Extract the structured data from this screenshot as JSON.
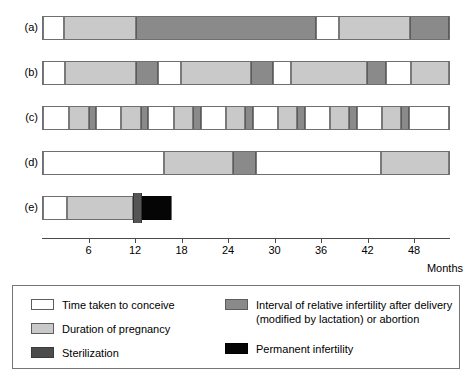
{
  "chart_data": {
    "type": "bar",
    "title": "",
    "subtitle": "",
    "xlabel": "Months",
    "ylabel": "",
    "xlim": [
      0,
      52.6
    ],
    "grid": false,
    "legend_position": "bottom",
    "axis": {
      "unit_label": "Months",
      "ticks": [
        6,
        12,
        18,
        24,
        30,
        36,
        42,
        48
      ],
      "tick_labels": [
        "6",
        "12",
        "18",
        "24",
        "30",
        "36",
        "42",
        "48"
      ],
      "start": 0,
      "end": 52.6
    },
    "categories": [
      "(a)",
      "(b)",
      "(c)",
      "(d)",
      "(e)"
    ],
    "series": [
      {
        "name": "Time taken to conceive",
        "key": "conceive",
        "color": "#ffffff"
      },
      {
        "name": "Duration of pregnancy",
        "key": "pregnancy",
        "color": "#c9c9c9"
      },
      {
        "name": "Sterilization",
        "key": "steril",
        "color": "#4c4c4c"
      },
      {
        "name": "Interval of relative infertility after delivery (modified by lactation) or abortion",
        "key": "infertile",
        "color": "#8a8a8a"
      },
      {
        "name": "Permanent infertility",
        "key": "permanent",
        "color": "#050505"
      }
    ],
    "rows": [
      {
        "label": "(a)",
        "segments": [
          {
            "type": "conceive",
            "start": 0.0,
            "end": 2.7
          },
          {
            "type": "pregnancy",
            "start": 2.7,
            "end": 12.0
          },
          {
            "type": "infertile",
            "start": 12.0,
            "end": 35.2
          },
          {
            "type": "conceive",
            "start": 35.2,
            "end": 38.2
          },
          {
            "type": "pregnancy",
            "start": 38.2,
            "end": 47.4
          },
          {
            "type": "infertile",
            "start": 47.4,
            "end": 52.4
          }
        ]
      },
      {
        "label": "(b)",
        "segments": [
          {
            "type": "conceive",
            "start": 0.0,
            "end": 2.8
          },
          {
            "type": "pregnancy",
            "start": 2.8,
            "end": 12.0
          },
          {
            "type": "infertile",
            "start": 12.0,
            "end": 14.9
          },
          {
            "type": "conceive",
            "start": 14.9,
            "end": 17.8
          },
          {
            "type": "pregnancy",
            "start": 17.8,
            "end": 26.8
          },
          {
            "type": "infertile",
            "start": 26.8,
            "end": 29.7
          },
          {
            "type": "conceive",
            "start": 29.7,
            "end": 32.0
          },
          {
            "type": "pregnancy",
            "start": 32.0,
            "end": 41.8
          },
          {
            "type": "infertile",
            "start": 41.8,
            "end": 44.3
          },
          {
            "type": "conceive",
            "start": 44.3,
            "end": 47.5
          },
          {
            "type": "pregnancy",
            "start": 47.5,
            "end": 52.4
          }
        ]
      },
      {
        "label": "(c)",
        "segments": [
          {
            "type": "conceive",
            "start": 0.0,
            "end": 3.4
          },
          {
            "type": "pregnancy",
            "start": 3.4,
            "end": 5.9
          },
          {
            "type": "infertile",
            "start": 5.9,
            "end": 6.9
          },
          {
            "type": "conceive",
            "start": 6.9,
            "end": 10.1
          },
          {
            "type": "pregnancy",
            "start": 10.1,
            "end": 12.6
          },
          {
            "type": "infertile",
            "start": 12.6,
            "end": 13.6
          },
          {
            "type": "conceive",
            "start": 13.6,
            "end": 16.9
          },
          {
            "type": "pregnancy",
            "start": 16.9,
            "end": 19.4
          },
          {
            "type": "infertile",
            "start": 19.4,
            "end": 20.4
          },
          {
            "type": "conceive",
            "start": 20.4,
            "end": 23.6
          },
          {
            "type": "pregnancy",
            "start": 23.6,
            "end": 26.1
          },
          {
            "type": "infertile",
            "start": 26.1,
            "end": 27.1
          },
          {
            "type": "conceive",
            "start": 27.1,
            "end": 30.3
          },
          {
            "type": "pregnancy",
            "start": 30.3,
            "end": 32.8
          },
          {
            "type": "infertile",
            "start": 32.8,
            "end": 33.8
          },
          {
            "type": "conceive",
            "start": 33.8,
            "end": 37.0
          },
          {
            "type": "pregnancy",
            "start": 37.0,
            "end": 39.5
          },
          {
            "type": "infertile",
            "start": 39.5,
            "end": 40.5
          },
          {
            "type": "conceive",
            "start": 40.5,
            "end": 43.7
          },
          {
            "type": "pregnancy",
            "start": 43.7,
            "end": 46.2
          },
          {
            "type": "infertile",
            "start": 46.2,
            "end": 47.2
          },
          {
            "type": "conceive",
            "start": 47.2,
            "end": 52.4
          }
        ]
      },
      {
        "label": "(d)",
        "segments": [
          {
            "type": "conceive",
            "start": 0.0,
            "end": 15.6
          },
          {
            "type": "pregnancy",
            "start": 15.6,
            "end": 24.5
          },
          {
            "type": "infertile",
            "start": 24.5,
            "end": 27.5
          },
          {
            "type": "conceive",
            "start": 27.5,
            "end": 43.6
          },
          {
            "type": "pregnancy",
            "start": 43.6,
            "end": 52.4
          }
        ]
      },
      {
        "label": "(e)",
        "segments": [
          {
            "type": "conceive",
            "start": 0.0,
            "end": 3.1
          },
          {
            "type": "pregnancy",
            "start": 3.1,
            "end": 11.6
          },
          {
            "type": "steril",
            "start": 11.6,
            "end": 12.8
          },
          {
            "type": "permanent",
            "start": 12.8,
            "end": 16.5
          }
        ]
      }
    ]
  },
  "legend": {
    "entries": [
      {
        "key": "conceive",
        "label": "Time taken to conceive"
      },
      {
        "key": "pregnancy",
        "label": "Duration of pregnancy"
      },
      {
        "key": "steril",
        "label": "Sterilization"
      },
      {
        "key": "infertile",
        "label": "Interval of relative infertility after delivery\n(modified by lactation) or abortion"
      },
      {
        "key": "permanent",
        "label": "Permanent infertility"
      }
    ]
  },
  "colors": {
    "conceive": "#ffffff",
    "pregnancy": "#c9c9c9",
    "infertile": "#8a8a8a",
    "steril": "#4c4c4c",
    "permanent": "#050505",
    "outline": "#6f6f6f",
    "axis": "#4a4a4a"
  }
}
